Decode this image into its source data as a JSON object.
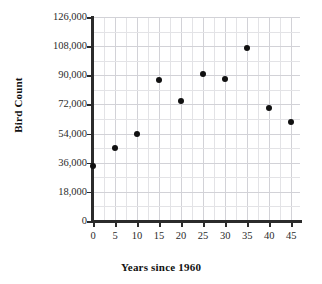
{
  "chart_data": {
    "type": "scatter",
    "title": "",
    "xlabel": "Years since 1960",
    "ylabel": "Bird Count",
    "xlim": [
      0,
      47
    ],
    "ylim": [
      0,
      126000
    ],
    "grid": true,
    "legend": "none",
    "x_ticks": [
      0,
      5,
      10,
      15,
      20,
      25,
      30,
      35,
      40,
      45
    ],
    "x_tick_labels": [
      "0",
      "5",
      "10",
      "15",
      "20",
      "25",
      "30",
      "35",
      "40",
      "45"
    ],
    "y_ticks": [
      0,
      18000,
      36000,
      54000,
      72000,
      90000,
      108000,
      126000
    ],
    "y_tick_labels": [
      "0",
      "18,000",
      "36,000",
      "54,000",
      "72,000",
      "90,000",
      "108,000",
      "126,000"
    ],
    "minor_grid_x_step": 2.5,
    "minor_grid_y_step": 9000,
    "point_color": "#111111",
    "grid_color": "#e3e3e6",
    "axis_color": "#2b2b2b",
    "x": [
      0,
      5,
      10,
      15,
      20,
      25,
      30,
      35,
      40,
      45
    ],
    "y": [
      34000,
      45000,
      54000,
      87000,
      74000,
      91000,
      88000,
      107000,
      70000,
      61000
    ],
    "points": [
      {
        "x": 0,
        "y": 34000
      },
      {
        "x": 5,
        "y": 45000
      },
      {
        "x": 10,
        "y": 54000
      },
      {
        "x": 15,
        "y": 87000
      },
      {
        "x": 20,
        "y": 74000
      },
      {
        "x": 25,
        "y": 91000
      },
      {
        "x": 30,
        "y": 88000
      },
      {
        "x": 35,
        "y": 107000
      },
      {
        "x": 40,
        "y": 70000
      },
      {
        "x": 45,
        "y": 61000
      }
    ]
  }
}
